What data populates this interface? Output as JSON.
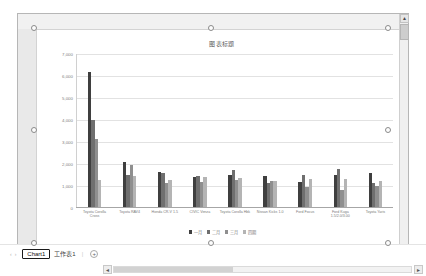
{
  "window": {
    "chart_sheet_name": "Chart1",
    "worksheet_name": "工作表1",
    "add_sheet_label": "+",
    "nav_prev": "‹",
    "nav_next": "›",
    "tab_separator": "|",
    "scroll_up": "▲",
    "scroll_left": "◄",
    "scroll_right": "►"
  },
  "chart_data": {
    "type": "bar",
    "title": "图表标题",
    "xlabel": "",
    "ylabel": "",
    "ylim": [
      0,
      7000
    ],
    "grid": true,
    "legend_position": "bottom",
    "ytick_labels": [
      "7,000",
      "6,000",
      "5,000",
      "4,000",
      "3,000",
      "2,000",
      "1,000",
      "0"
    ],
    "yticks": [
      7000,
      6000,
      5000,
      4000,
      3000,
      2000,
      1000,
      0
    ],
    "categories": [
      "Toyota Corolla Cross",
      "Toyota RAV4",
      "Honda CR-V 1.5",
      "CIVIC Venza",
      "Toyota Corolla Hbk",
      "Nissan Kicks 1.0",
      "Ford Focus",
      "Ford Kuga 1.5/2.0/3.00",
      "Toyota Yaris"
    ],
    "series": [
      {
        "name": "一月",
        "color": "#3f3f3f",
        "values": [
          6200,
          2050,
          1580,
          1380,
          1480,
          1400,
          1140,
          1480,
          1560
        ]
      },
      {
        "name": "二月",
        "color": "#6f6f6f",
        "values": [
          4000,
          1450,
          1550,
          1400,
          1700,
          1080,
          1450,
          1750,
          1100
        ]
      },
      {
        "name": "三月",
        "color": "#8f8f8f",
        "values": [
          3100,
          1900,
          1100,
          1150,
          1250,
          1180,
          900,
          800,
          950
        ]
      },
      {
        "name": "四期",
        "color": "#b4b4b4",
        "values": [
          1250,
          1400,
          1250,
          1380,
          1350,
          1200,
          1300,
          1300,
          1180
        ]
      }
    ]
  }
}
